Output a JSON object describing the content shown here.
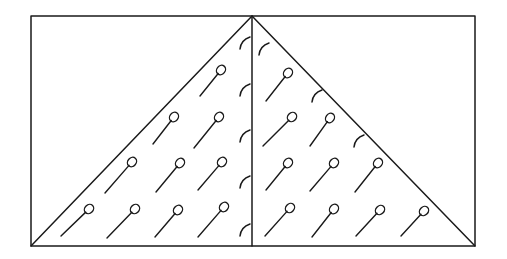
{
  "diagram": {
    "stroke_color": "#1a1a1a",
    "background": "#ffffff",
    "frame": {
      "x1": 31,
      "y1": 16,
      "x2": 475,
      "y2": 246
    },
    "midline_x": 252,
    "triangle": {
      "apex": [
        252,
        16
      ],
      "left": [
        31,
        246
      ],
      "right": [
        475,
        246
      ]
    },
    "pins": [
      {
        "head": [
          221,
          70
        ],
        "tail": [
          200,
          96
        ]
      },
      {
        "head": [
          174,
          117
        ],
        "tail": [
          153,
          144
        ]
      },
      {
        "head": [
          219,
          117
        ],
        "tail": [
          194,
          148
        ]
      },
      {
        "head": [
          132,
          162
        ],
        "tail": [
          105,
          193
        ]
      },
      {
        "head": [
          180,
          163
        ],
        "tail": [
          156,
          192
        ]
      },
      {
        "head": [
          222,
          162
        ],
        "tail": [
          198,
          190
        ]
      },
      {
        "head": [
          89,
          209
        ],
        "tail": [
          61,
          236
        ]
      },
      {
        "head": [
          135,
          209
        ],
        "tail": [
          107,
          238
        ]
      },
      {
        "head": [
          178,
          210
        ],
        "tail": [
          155,
          237
        ]
      },
      {
        "head": [
          224,
          207
        ],
        "tail": [
          198,
          237
        ]
      },
      {
        "head": [
          288,
          73
        ],
        "tail": [
          266,
          101
        ]
      },
      {
        "head": [
          292,
          117
        ],
        "tail": [
          263,
          146
        ]
      },
      {
        "head": [
          330,
          118
        ],
        "tail": [
          310,
          146
        ]
      },
      {
        "head": [
          288,
          163
        ],
        "tail": [
          266,
          190
        ]
      },
      {
        "head": [
          334,
          163
        ],
        "tail": [
          310,
          191
        ]
      },
      {
        "head": [
          378,
          163
        ],
        "tail": [
          355,
          192
        ]
      },
      {
        "head": [
          290,
          208
        ],
        "tail": [
          265,
          236
        ]
      },
      {
        "head": [
          334,
          209
        ],
        "tail": [
          312,
          237
        ]
      },
      {
        "head": [
          380,
          210
        ],
        "tail": [
          356,
          236
        ]
      },
      {
        "head": [
          424,
          211
        ],
        "tail": [
          401,
          236
        ]
      }
    ],
    "arcs": [
      {
        "x": 243,
        "y": 42
      },
      {
        "x": 243,
        "y": 89
      },
      {
        "x": 243,
        "y": 135
      },
      {
        "x": 243,
        "y": 181
      },
      {
        "x": 243,
        "y": 229
      },
      {
        "x": 262,
        "y": 48
      },
      {
        "x": 315,
        "y": 95
      },
      {
        "x": 357,
        "y": 140
      }
    ]
  }
}
